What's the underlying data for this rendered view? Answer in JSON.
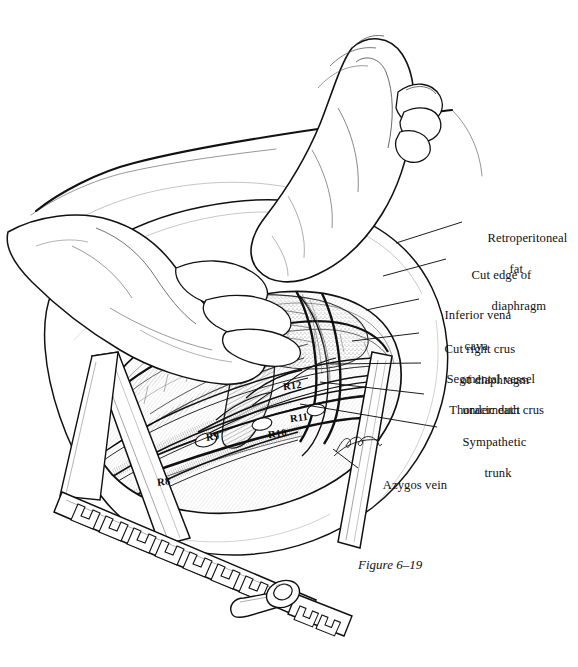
{
  "figure": {
    "caption": "Figure 6–19",
    "background_color": "#ffffff",
    "ink_color": "#111111",
    "width": 578,
    "height": 667
  },
  "labels": [
    {
      "id": "retroperitoneal-fat",
      "line1": "Retroperitoneal",
      "line2": "fat",
      "x": 468,
      "y": 215,
      "indent2": 22
    },
    {
      "id": "cut-edge-of-diaphragm",
      "line1": "Cut edge of",
      "line2": "diaphragm",
      "x": 452,
      "y": 252,
      "indent2": 20
    },
    {
      "id": "inferior-vena-cava",
      "line1": "Inferior vena",
      "line2": "cava",
      "x": 425,
      "y": 292,
      "indent2": 20
    },
    {
      "id": "cut-right-crus-of-diaphragm",
      "line1": "Cut right crus",
      "line2": "of diaphragm",
      "x": 425,
      "y": 326,
      "indent2": 16
    },
    {
      "id": "segmental-vessel-underneath-crus",
      "line1": "Segmental vessel",
      "line2": "underneath crus",
      "x": 427,
      "y": 356,
      "indent2": 16
    },
    {
      "id": "thoracic-duct",
      "line1": "Thoracic duct",
      "line2": "",
      "x": 430,
      "y": 387,
      "indent2": 0
    },
    {
      "id": "sympathetic-trunk",
      "line1": "Sympathetic",
      "line2": "trunk",
      "x": 443,
      "y": 419,
      "indent2": 22
    },
    {
      "id": "azygos-vein",
      "line1": "Azygos vein",
      "line2": "",
      "x": 364,
      "y": 462,
      "indent2": 0
    }
  ],
  "rib_tags": [
    {
      "id": "rib-12",
      "text": "R12",
      "x": 283,
      "y": 386
    },
    {
      "id": "rib-11",
      "text": "R11",
      "x": 290,
      "y": 418
    },
    {
      "id": "rib-10",
      "text": "R10",
      "x": 268,
      "y": 434
    },
    {
      "id": "rib-9",
      "text": "R9",
      "x": 206,
      "y": 437
    },
    {
      "id": "rib-8",
      "text": "R8",
      "x": 157,
      "y": 482
    }
  ],
  "leader_lines": [
    {
      "id": "leader-retroperitoneal-fat",
      "x1": 396,
      "y1": 243,
      "x2": 462,
      "y2": 222
    },
    {
      "id": "leader-cut-edge-of-diaphragm",
      "x1": 383,
      "y1": 276,
      "x2": 446,
      "y2": 259
    },
    {
      "id": "leader-inferior-vena-cava",
      "x1": 366,
      "y1": 310,
      "x2": 419,
      "y2": 299
    },
    {
      "id": "leader-cut-right-crus",
      "x1": 352,
      "y1": 341,
      "x2": 419,
      "y2": 333
    },
    {
      "id": "leader-segmental-vessel",
      "x1": 330,
      "y1": 364,
      "x2": 421,
      "y2": 363
    },
    {
      "id": "leader-thoracic-duct",
      "x1": 320,
      "y1": 382,
      "x2": 424,
      "y2": 394
    },
    {
      "id": "leader-sympathetic-trunk",
      "x1": 300,
      "y1": 404,
      "x2": 437,
      "y2": 427
    },
    {
      "id": "leader-azygos-vein",
      "x1": 333,
      "y1": 449,
      "x2": 358,
      "y2": 468
    }
  ],
  "instruments": {
    "retractor_name": "rib-spreader-retractor",
    "parts": [
      "left-blade",
      "right-blade",
      "ratchet-rack-bar",
      "crank-handle",
      "pivot-bolt"
    ]
  },
  "scene_elements": {
    "hands": [
      "surgeon-right-hand",
      "surgeon-left-hand"
    ],
    "artist_signature": "artist-signature"
  }
}
